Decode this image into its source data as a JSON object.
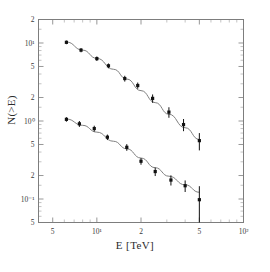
{
  "figure": {
    "width": 270,
    "height": 272,
    "background": "#ffffff",
    "frame_color": "#7d7d7d",
    "marker_color": "#111111",
    "curve_color": "#808080"
  },
  "chart_data": {
    "type": "scatter",
    "title": "",
    "subtitle": "",
    "xlabel": "E [TeV]",
    "ylabel": "N(>E)",
    "xscale": "log",
    "yscale": "log",
    "xlim": [
      4.0,
      100.0
    ],
    "ylim": [
      0.05,
      20.0
    ],
    "grid": false,
    "legend": null,
    "xticks": [
      {
        "value": 5,
        "label": "5",
        "major": true
      },
      {
        "value": 10,
        "label": "10¹",
        "major": true
      },
      {
        "value": 20,
        "label": "2",
        "major": true
      },
      {
        "value": 50,
        "label": "5",
        "major": true
      },
      {
        "value": 100,
        "label": "10²",
        "major": true
      }
    ],
    "xminor": [
      6,
      7,
      8,
      9,
      30,
      40,
      60,
      70,
      80,
      90
    ],
    "yticks": [
      {
        "value": 20,
        "label": "2",
        "major": true
      },
      {
        "value": 10,
        "label": "10¹",
        "major": true
      },
      {
        "value": 5,
        "label": "5",
        "major": true
      },
      {
        "value": 2,
        "label": "2",
        "major": true
      },
      {
        "value": 1,
        "label": "10⁰",
        "major": true
      },
      {
        "value": 0.5,
        "label": "5",
        "major": true
      },
      {
        "value": 0.2,
        "label": "2",
        "major": true
      },
      {
        "value": 0.1,
        "label": "10⁻¹",
        "major": true
      },
      {
        "value": 0.05,
        "label": "5",
        "major": true
      }
    ],
    "yminor": [
      15,
      9,
      8,
      7,
      6,
      4,
      3,
      1.5,
      0.9,
      0.8,
      0.7,
      0.6,
      0.4,
      0.3,
      0.15,
      0.09,
      0.08,
      0.07,
      0.06
    ],
    "series": [
      {
        "name": "upper",
        "marker": "square",
        "points": [
          {
            "x": 6.2,
            "y": 10.2,
            "yerr": 0.55
          },
          {
            "x": 7.8,
            "y": 8.1,
            "yerr": 0.5
          },
          {
            "x": 10.0,
            "y": 6.3,
            "yerr": 0.42
          },
          {
            "x": 12.0,
            "y": 5.1,
            "yerr": 0.36
          },
          {
            "x": 15.5,
            "y": 3.5,
            "yerr": 0.3
          },
          {
            "x": 19.0,
            "y": 2.85,
            "yerr": 0.26
          },
          {
            "x": 24.0,
            "y": 1.95,
            "yerr": 0.24
          },
          {
            "x": 31.0,
            "y": 1.3,
            "yerr": 0.2
          },
          {
            "x": 39.0,
            "y": 0.9,
            "yerr": 0.16
          },
          {
            "x": 50.0,
            "y": 0.56,
            "yerr": 0.14
          }
        ]
      },
      {
        "name": "lower",
        "marker": "square",
        "points": [
          {
            "x": 6.2,
            "y": 1.05,
            "yerr": 0.07
          },
          {
            "x": 7.6,
            "y": 0.92,
            "yerr": 0.08
          },
          {
            "x": 9.6,
            "y": 0.8,
            "yerr": 0.07
          },
          {
            "x": 11.8,
            "y": 0.62,
            "yerr": 0.05
          },
          {
            "x": 16.0,
            "y": 0.46,
            "yerr": 0.045
          },
          {
            "x": 20.0,
            "y": 0.305,
            "yerr": 0.03
          },
          {
            "x": 25.0,
            "y": 0.225,
            "yerr": 0.028
          },
          {
            "x": 32.0,
            "y": 0.175,
            "yerr": 0.026
          },
          {
            "x": 40.0,
            "y": 0.148,
            "yerr": 0.025
          },
          {
            "x": 50.0,
            "y": 0.098,
            "yerr": 0.048
          }
        ]
      }
    ],
    "fits": [
      {
        "name": "upper-fit",
        "points": [
          {
            "x": 6.2,
            "y": 10.3
          },
          {
            "x": 8.0,
            "y": 8.1
          },
          {
            "x": 10.0,
            "y": 6.35
          },
          {
            "x": 13.0,
            "y": 4.6
          },
          {
            "x": 16.0,
            "y": 3.45
          },
          {
            "x": 20.0,
            "y": 2.45
          },
          {
            "x": 25.0,
            "y": 1.72
          },
          {
            "x": 31.0,
            "y": 1.22
          },
          {
            "x": 40.0,
            "y": 0.82
          },
          {
            "x": 50.0,
            "y": 0.58
          }
        ]
      },
      {
        "name": "lower-fit",
        "points": [
          {
            "x": 6.2,
            "y": 1.06
          },
          {
            "x": 8.0,
            "y": 0.88
          },
          {
            "x": 10.0,
            "y": 0.72
          },
          {
            "x": 13.0,
            "y": 0.55
          },
          {
            "x": 16.0,
            "y": 0.44
          },
          {
            "x": 20.0,
            "y": 0.335
          },
          {
            "x": 25.0,
            "y": 0.252
          },
          {
            "x": 31.0,
            "y": 0.196
          },
          {
            "x": 40.0,
            "y": 0.152
          },
          {
            "x": 50.0,
            "y": 0.122
          }
        ]
      }
    ]
  }
}
